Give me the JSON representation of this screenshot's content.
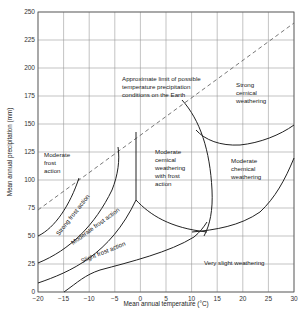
{
  "chart_data": {
    "type": "line",
    "title": "",
    "xlabel": "Mean annual temperature (°C)",
    "ylabel": "Mean annual precipitation (mm)",
    "xlim": [
      -20,
      30
    ],
    "ylim": [
      0,
      250
    ],
    "x_ticks": [
      "−20",
      "−15",
      "−10",
      "−5",
      "0",
      "5",
      "10",
      "15",
      "20",
      "25",
      "30"
    ],
    "y_ticks": [
      "0",
      "25",
      "50",
      "75",
      "100",
      "125",
      "150",
      "175",
      "200",
      "225",
      "250"
    ],
    "grid": true,
    "legend": null,
    "limit_line": {
      "name": "Approximate limit of possible temperature precipitation conditions on the Earth",
      "style": "dashed",
      "points": [
        [
          -20,
          73
        ],
        [
          30,
          240
        ]
      ]
    },
    "region_labels": [
      {
        "text": "Moderate frost action",
        "x": -19,
        "y": 113
      },
      {
        "text": "Strong frost action",
        "x": -15,
        "y": 48,
        "rotation": -50
      },
      {
        "text": "Moderate frost action",
        "x": -10,
        "y": 36,
        "rotation": -35
      },
      {
        "text": "Slight frost action",
        "x": -9,
        "y": 16,
        "rotation": -22
      },
      {
        "text": "Moderate cemical weathering with frost action",
        "x": 0.5,
        "y": 120
      },
      {
        "text": "Strong cemical weathering",
        "x": 22,
        "y": 185
      },
      {
        "text": "Moderate chemical weathering",
        "x": 19,
        "y": 115
      },
      {
        "text": "Very slight weathering",
        "x": 17,
        "y": 26
      }
    ]
  },
  "labels": {
    "limit_line": [
      "Approximate limit of possible",
      "temperature precipitation",
      "conditions on the Earth"
    ],
    "moderate_frost_top": [
      "Moderate",
      "frost",
      "action"
    ],
    "strong_frost": "Strong frost action",
    "moderate_frost": "Moderate frost action",
    "slight_frost": "Slight frost action",
    "mod_cem_frost": [
      "Moderate",
      "cemical",
      "weathering",
      "with frost",
      "action"
    ],
    "strong_cem": [
      "Strong",
      "cemical",
      "weathering"
    ],
    "mod_chem": [
      "Moderate",
      "chemical",
      "weathering"
    ],
    "very_slight": "Very slight weathering"
  }
}
